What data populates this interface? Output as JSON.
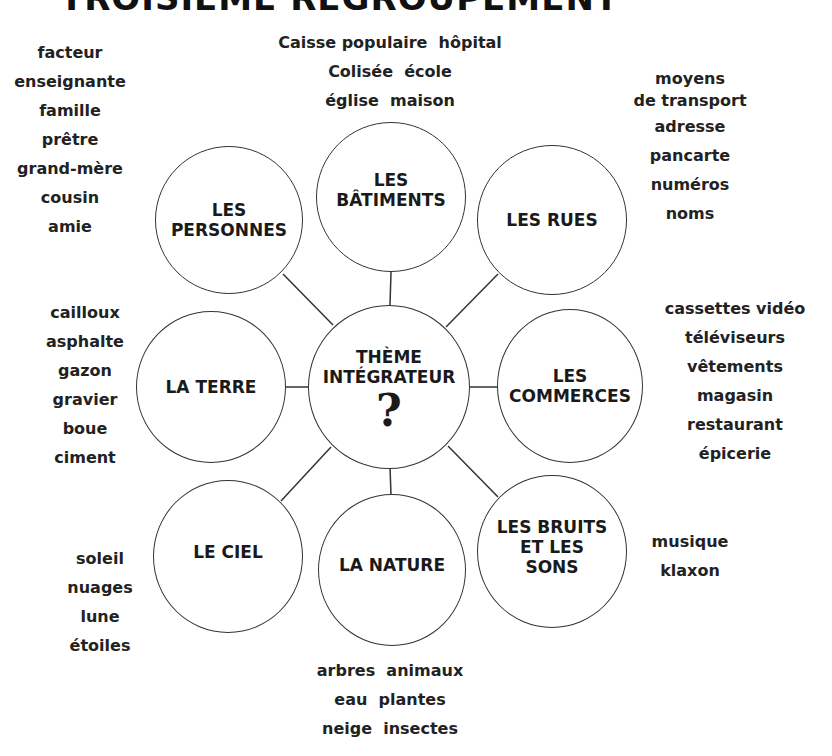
{
  "title": "TROISIÈME REGROUPEMENT",
  "center": {
    "line1": "THÈME",
    "line2": "INTÉGRATEUR",
    "symbol": "?"
  },
  "categories": {
    "personnes": {
      "line1": "LES",
      "line2": "PERSONNES"
    },
    "batiments": {
      "line1": "LES",
      "line2": "BÂTIMENTS"
    },
    "rues": {
      "line1": "LES RUES"
    },
    "terre": {
      "line1": "LA TERRE"
    },
    "commerces": {
      "line1": "LES",
      "line2": "COMMERCES"
    },
    "ciel": {
      "line1": "LE CIEL"
    },
    "nature": {
      "line1": "LA NATURE"
    },
    "bruits": {
      "line1": "LES BRUITS",
      "line2": "ET LES",
      "line3": "SONS"
    }
  },
  "lists": {
    "personnes": [
      "facteur",
      "enseignante",
      "famille",
      "prêtre",
      "grand-mère",
      "cousin",
      "amie"
    ],
    "batiments": [
      "Caisse populaire  hôpital",
      "Colisée  école",
      "église  maison"
    ],
    "rues": [
      "moyens",
      "de transport",
      "adresse",
      "pancarte",
      "numéros",
      "noms"
    ],
    "terre": [
      "cailloux",
      "asphalte",
      "gazon",
      "gravier",
      "boue",
      "ciment"
    ],
    "commerces": [
      "cassettes vidéo",
      "téléviseurs",
      "vêtements",
      "magasin",
      "restaurant",
      "épicerie"
    ],
    "ciel": [
      "soleil",
      "nuages",
      "lune",
      "étoiles"
    ],
    "nature": [
      "arbres  animaux",
      "eau  plantes",
      "neige  insectes"
    ],
    "bruits": [
      "musique",
      "klaxon"
    ]
  }
}
